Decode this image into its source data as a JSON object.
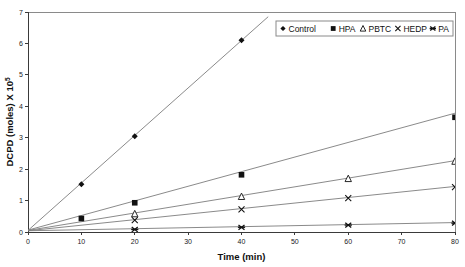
{
  "chart_data": {
    "type": "scatter",
    "title": "",
    "xlabel": "Time (min)",
    "ylabel": "DCPD (moles) X 10",
    "ylabel_exponent": "5",
    "xlim": [
      0,
      80
    ],
    "ylim": [
      0,
      7
    ],
    "xticks": [
      0,
      10,
      20,
      30,
      40,
      50,
      60,
      70,
      80
    ],
    "yticks": [
      0,
      1,
      2,
      3,
      4,
      5,
      6,
      7
    ],
    "xtick_labels": [
      "0",
      "10",
      "20",
      "30",
      "40",
      "50",
      "60",
      "70",
      "80"
    ],
    "ytick_labels": [
      "0",
      "1",
      "2",
      "3",
      "4",
      "5",
      "6",
      "7"
    ],
    "grid": false,
    "legend_position": "top-right",
    "series": [
      {
        "name": "Control",
        "marker": "diamond",
        "x": [
          0,
          10,
          20,
          40
        ],
        "y": [
          0.1,
          1.52,
          3.05,
          6.1
        ],
        "trend_x": [
          0,
          45
        ],
        "trend_y": [
          0.05,
          6.85
        ]
      },
      {
        "name": "HPA",
        "marker": "square",
        "x": [
          0,
          10,
          20,
          40,
          80
        ],
        "y": [
          0.08,
          0.43,
          0.93,
          1.82,
          3.65
        ],
        "trend_x": [
          0,
          80
        ],
        "trend_y": [
          0.06,
          3.78
        ]
      },
      {
        "name": "PBTC",
        "marker": "triangle",
        "x": [
          0,
          20,
          40,
          60,
          80
        ],
        "y": [
          0.07,
          0.58,
          1.13,
          1.7,
          2.25
        ],
        "trend_x": [
          0,
          80
        ],
        "trend_y": [
          0.05,
          2.27
        ]
      },
      {
        "name": "HEDP",
        "marker": "cross",
        "x": [
          0,
          20,
          40,
          60,
          80
        ],
        "y": [
          0.06,
          0.38,
          0.72,
          1.08,
          1.43
        ],
        "trend_x": [
          0,
          80
        ],
        "trend_y": [
          0.04,
          1.45
        ]
      },
      {
        "name": "PA",
        "marker": "star",
        "x": [
          0,
          20,
          40,
          60,
          80
        ],
        "y": [
          0.05,
          0.08,
          0.15,
          0.22,
          0.28
        ],
        "trend_x": [
          0,
          80
        ],
        "trend_y": [
          0.04,
          0.3
        ]
      }
    ]
  },
  "legend": {
    "entries": [
      {
        "label": "Control",
        "marker": "diamond"
      },
      {
        "label": "HPA",
        "marker": "square"
      },
      {
        "label": "PBTC",
        "marker": "triangle"
      },
      {
        "label": "HEDP",
        "marker": "cross"
      },
      {
        "label": "PA",
        "marker": "star"
      }
    ]
  },
  "colors": {
    "axis": "#3a3a3a",
    "frame": "#8a8a8a",
    "trendline": "#7d7d7d",
    "marker": "#111111",
    "background": "#ffffff"
  }
}
